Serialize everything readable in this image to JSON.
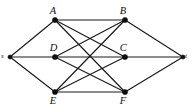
{
  "figure": {
    "kind": "undirected-graph-diagram",
    "background_color": "#ffffff",
    "ink_color": "#1a1a1a",
    "width": 193,
    "height": 112
  },
  "graph": {
    "nodes": [
      {
        "id": "s",
        "label": "s",
        "x": 10,
        "y": 57,
        "label_dx": -7,
        "label_dy": -4,
        "size": "terminal",
        "role": "source"
      },
      {
        "id": "A",
        "label": "A",
        "x": 55,
        "y": 20,
        "label_dx": -2,
        "label_dy": -14,
        "size": "inner",
        "role": "intermediate"
      },
      {
        "id": "B",
        "label": "B",
        "x": 125,
        "y": 20,
        "label_dx": -2,
        "label_dy": -14,
        "size": "inner",
        "role": "intermediate"
      },
      {
        "id": "D",
        "label": "D",
        "x": 55,
        "y": 57,
        "label_dx": -2,
        "label_dy": -14,
        "size": "inner",
        "role": "intermediate"
      },
      {
        "id": "C",
        "label": "C",
        "x": 125,
        "y": 57,
        "label_dx": -2,
        "label_dy": -14,
        "size": "inner",
        "role": "intermediate"
      },
      {
        "id": "E",
        "label": "E",
        "x": 55,
        "y": 92,
        "label_dx": -2,
        "label_dy": 4,
        "size": "inner",
        "role": "intermediate"
      },
      {
        "id": "F",
        "label": "F",
        "x": 125,
        "y": 92,
        "label_dx": -2,
        "label_dy": 4,
        "size": "inner",
        "role": "intermediate"
      },
      {
        "id": "t",
        "label": "t",
        "x": 183,
        "y": 57,
        "label_dx": 4,
        "label_dy": -4,
        "size": "terminal",
        "role": "sink"
      }
    ],
    "edges": [
      {
        "from": "s",
        "to": "A"
      },
      {
        "from": "s",
        "to": "D"
      },
      {
        "from": "s",
        "to": "E"
      },
      {
        "from": "A",
        "to": "B"
      },
      {
        "from": "A",
        "to": "C"
      },
      {
        "from": "A",
        "to": "F"
      },
      {
        "from": "D",
        "to": "B"
      },
      {
        "from": "D",
        "to": "C"
      },
      {
        "from": "D",
        "to": "F"
      },
      {
        "from": "E",
        "to": "B"
      },
      {
        "from": "E",
        "to": "C"
      },
      {
        "from": "E",
        "to": "F"
      },
      {
        "from": "B",
        "to": "t"
      },
      {
        "from": "C",
        "to": "t"
      },
      {
        "from": "F",
        "to": "t"
      }
    ]
  }
}
